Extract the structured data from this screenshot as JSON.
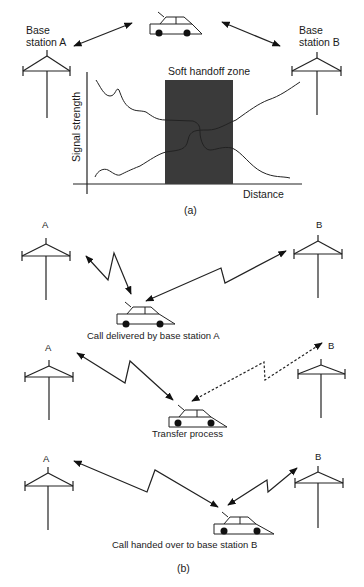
{
  "figure": {
    "part_a": {
      "caption": "(a)",
      "station_a_label_line1": "Base",
      "station_a_label_line2": "station A",
      "station_b_label_line1": "Base",
      "station_b_label_line2": "station B",
      "zone_label": "Soft handoff zone",
      "ylabel": "Signal strength",
      "xlabel": "Distance",
      "zone_color": "#3a3a3a"
    },
    "part_b": {
      "caption": "(b)",
      "scenarios": [
        {
          "station_a": "A",
          "station_b": "B",
          "caption": "Call delivered by base station A",
          "link_a": "solid",
          "link_b": "solid"
        },
        {
          "station_a": "A",
          "station_b": "B",
          "caption": "Transfer process",
          "link_a": "solid",
          "link_b": "dashed"
        },
        {
          "station_a": "A",
          "station_b": "B",
          "caption": "Call handed over to base station B",
          "link_a": "solid",
          "link_b": "solid"
        }
      ]
    }
  }
}
